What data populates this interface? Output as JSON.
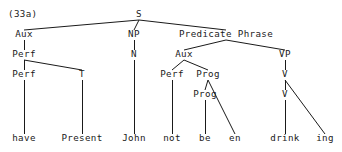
{
  "figure": {
    "number_label": "(33a)",
    "type": "syntax-tree-diagram",
    "ink_color": "#1a1a1a",
    "background_color": "#ffffff"
  },
  "tree": {
    "nodes": [
      {
        "id": "s",
        "label": "S",
        "x": 139,
        "y": 17,
        "kind": "nonterminal"
      },
      {
        "id": "aux1",
        "label": "Aux",
        "x": 24,
        "y": 37,
        "kind": "nonterminal"
      },
      {
        "id": "np",
        "label": "NP",
        "x": 134,
        "y": 37,
        "kind": "nonterminal"
      },
      {
        "id": "predphrase",
        "label": "Predicate Phrase",
        "x": 226,
        "y": 37,
        "kind": "nonterminal"
      },
      {
        "id": "perf1",
        "label": "Perf",
        "x": 24,
        "y": 57,
        "kind": "nonterminal"
      },
      {
        "id": "n",
        "label": "N",
        "x": 134,
        "y": 57,
        "kind": "nonterminal"
      },
      {
        "id": "aux2",
        "label": "Aux",
        "x": 184,
        "y": 57,
        "kind": "nonterminal"
      },
      {
        "id": "vp",
        "label": "VP",
        "x": 285,
        "y": 57,
        "kind": "nonterminal"
      },
      {
        "id": "perf2",
        "label": "Perf",
        "x": 24,
        "y": 77,
        "kind": "nonterminal"
      },
      {
        "id": "t",
        "label": "T",
        "x": 82,
        "y": 77,
        "kind": "nonterminal"
      },
      {
        "id": "perf3",
        "label": "Perf",
        "x": 172,
        "y": 77,
        "kind": "nonterminal"
      },
      {
        "id": "prog1",
        "label": "Prog",
        "x": 208,
        "y": 77,
        "kind": "nonterminal"
      },
      {
        "id": "v1",
        "label": "V",
        "x": 285,
        "y": 77,
        "kind": "nonterminal"
      },
      {
        "id": "prog2",
        "label": "Prog",
        "x": 205,
        "y": 97,
        "kind": "nonterminal"
      },
      {
        "id": "v2",
        "label": "V",
        "x": 285,
        "y": 97,
        "kind": "nonterminal"
      },
      {
        "id": "have",
        "label": "have",
        "x": 24,
        "y": 141,
        "kind": "terminal"
      },
      {
        "id": "present",
        "label": "Present",
        "x": 82,
        "y": 141,
        "kind": "terminal"
      },
      {
        "id": "john",
        "label": "John",
        "x": 134,
        "y": 141,
        "kind": "terminal"
      },
      {
        "id": "not",
        "label": "not",
        "x": 172,
        "y": 141,
        "kind": "terminal"
      },
      {
        "id": "be",
        "label": "be",
        "x": 205,
        "y": 141,
        "kind": "terminal"
      },
      {
        "id": "en",
        "label": "en",
        "x": 235,
        "y": 141,
        "kind": "terminal"
      },
      {
        "id": "drink",
        "label": "drink",
        "x": 285,
        "y": 141,
        "kind": "terminal"
      },
      {
        "id": "ing",
        "label": "ing",
        "x": 325,
        "y": 141,
        "kind": "terminal"
      }
    ],
    "edges": [
      {
        "from": "s",
        "to": "aux1",
        "x1": 139,
        "y1": 20,
        "x2": 24,
        "y2": 30
      },
      {
        "from": "s",
        "to": "np",
        "x1": 139,
        "y1": 20,
        "x2": 134,
        "y2": 30
      },
      {
        "from": "s",
        "to": "predphrase",
        "x1": 139,
        "y1": 20,
        "x2": 226,
        "y2": 30
      },
      {
        "from": "aux1",
        "to": "perf1",
        "x1": 24,
        "y1": 40,
        "x2": 24,
        "y2": 50
      },
      {
        "from": "np",
        "to": "n",
        "x1": 134,
        "y1": 40,
        "x2": 134,
        "y2": 50
      },
      {
        "from": "predphrase",
        "to": "aux2",
        "x1": 226,
        "y1": 40,
        "x2": 184,
        "y2": 50
      },
      {
        "from": "predphrase",
        "to": "vp",
        "x1": 226,
        "y1": 40,
        "x2": 285,
        "y2": 50
      },
      {
        "from": "perf1",
        "to": "perf2",
        "x1": 24,
        "y1": 60,
        "x2": 24,
        "y2": 70
      },
      {
        "from": "perf1",
        "to": "t",
        "x1": 24,
        "y1": 60,
        "x2": 82,
        "y2": 70
      },
      {
        "from": "n",
        "to": "john",
        "x1": 134,
        "y1": 60,
        "x2": 134,
        "y2": 134
      },
      {
        "from": "aux2",
        "to": "perf3",
        "x1": 184,
        "y1": 60,
        "x2": 172,
        "y2": 70
      },
      {
        "from": "aux2",
        "to": "prog1",
        "x1": 184,
        "y1": 60,
        "x2": 208,
        "y2": 70
      },
      {
        "from": "vp",
        "to": "v1",
        "x1": 285,
        "y1": 60,
        "x2": 285,
        "y2": 70
      },
      {
        "from": "perf2",
        "to": "have",
        "x1": 24,
        "y1": 80,
        "x2": 24,
        "y2": 134
      },
      {
        "from": "t",
        "to": "present",
        "x1": 82,
        "y1": 80,
        "x2": 82,
        "y2": 134
      },
      {
        "from": "perf3",
        "to": "not",
        "x1": 172,
        "y1": 80,
        "x2": 172,
        "y2": 134
      },
      {
        "from": "prog1",
        "to": "prog2",
        "x1": 208,
        "y1": 80,
        "x2": 205,
        "y2": 90
      },
      {
        "from": "prog1",
        "to": "en",
        "x1": 208,
        "y1": 80,
        "x2": 235,
        "y2": 134
      },
      {
        "from": "v1",
        "to": "v2",
        "x1": 285,
        "y1": 80,
        "x2": 285,
        "y2": 90
      },
      {
        "from": "v1",
        "to": "ing",
        "x1": 285,
        "y1": 80,
        "x2": 325,
        "y2": 134
      },
      {
        "from": "prog2",
        "to": "be",
        "x1": 205,
        "y1": 100,
        "x2": 205,
        "y2": 134
      },
      {
        "from": "v2",
        "to": "drink",
        "x1": 285,
        "y1": 100,
        "x2": 285,
        "y2": 134
      }
    ],
    "sentence": "have Present John not be en drink ing",
    "figure_label_position": {
      "x": 8,
      "y": 17
    }
  }
}
